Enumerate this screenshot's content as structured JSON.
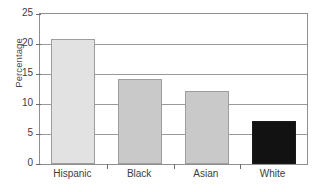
{
  "chart_data": {
    "type": "bar",
    "title": "",
    "xlabel": "",
    "ylabel": "Percentage",
    "categories": [
      "Hispanic",
      "Black",
      "Asian",
      "White"
    ],
    "values": [
      20.8,
      14.2,
      12.1,
      7.2
    ],
    "ylim": [
      0,
      25
    ],
    "yticks": [
      0,
      5,
      10,
      15,
      20,
      25
    ],
    "ytick_labels": [
      "0",
      "5",
      "10",
      "15",
      "20",
      "25"
    ],
    "grid": true,
    "legend": "none",
    "bar_colors": [
      "#e2e2e2",
      "#c9c9c9",
      "#c9c9c9",
      "#121212"
    ],
    "bar_border_colors": [
      "#9d9d9d",
      "#9d9d9d",
      "#9d9d9d",
      "#1a1a1a"
    ]
  },
  "axes": {
    "frame_color": "#8f8f8f",
    "gridline_color": "#9a9a9a",
    "tick_color": "#6b6b6b",
    "text_color": "#3d3d3d"
  }
}
